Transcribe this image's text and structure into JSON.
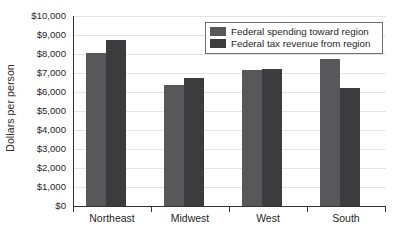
{
  "chart_data": {
    "type": "bar",
    "title": "",
    "xlabel": "",
    "ylabel": "Dollars per person",
    "categories": [
      "Northeast",
      "Midwest",
      "West",
      "South"
    ],
    "series": [
      {
        "name": "Federal spending toward region",
        "color": "#58585a",
        "values": [
          8050,
          6350,
          7150,
          7750
        ]
      },
      {
        "name": "Federal tax revenue from region",
        "color": "#3c3c3e",
        "values": [
          8750,
          6750,
          7200,
          6200
        ]
      }
    ],
    "ylim": [
      0,
      10000
    ],
    "ytick_values": [
      0,
      1000,
      2000,
      3000,
      4000,
      5000,
      6000,
      7000,
      8000,
      9000,
      10000
    ],
    "ytick_labels": [
      "$0",
      "$1,000",
      "$2,000",
      "$3,000",
      "$4,000",
      "$5,000",
      "$6,000",
      "$7,000",
      "$8,000",
      "$9,000",
      "$10,000"
    ],
    "grid": true,
    "legend_position": "top-right"
  },
  "legend": {
    "entries": [
      {
        "label": "Federal spending toward region"
      },
      {
        "label": "Federal tax revenue from region"
      }
    ]
  },
  "axis": {
    "y_title": "Dollars per person"
  }
}
